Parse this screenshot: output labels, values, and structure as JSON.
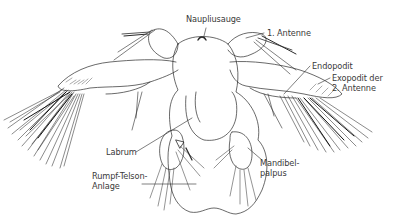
{
  "figure": {
    "labels": {
      "naupliusauge": "Naupliusauge",
      "antenne1": "1. Antenne",
      "endopodit": "Endopodit",
      "exopodit_line1": "Exopodit der",
      "exopodit_line2": "2. Antenne",
      "labrum": "Labrum",
      "mandibel_line1": "Mandibel-",
      "mandibel_line2": "palpus",
      "rumpf_line1": "Rumpf-Telson-",
      "rumpf_line2": "Anlage"
    },
    "colors": {
      "line": "#2a2a2a",
      "text": "#3a3a3a",
      "background": "#ffffff"
    }
  }
}
